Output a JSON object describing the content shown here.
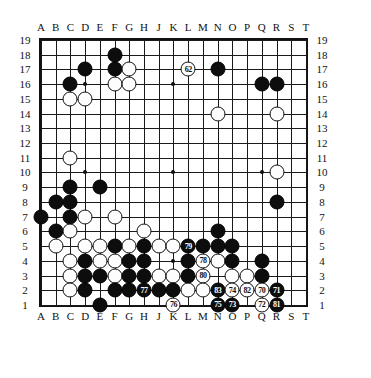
{
  "board": {
    "size": 19,
    "col_labels": [
      "A",
      "B",
      "C",
      "D",
      "E",
      "F",
      "G",
      "H",
      "J",
      "K",
      "L",
      "M",
      "N",
      "O",
      "P",
      "Q",
      "R",
      "S",
      "T"
    ],
    "row_labels_left": [
      "19",
      "18",
      "17",
      "16",
      "15",
      "14",
      "13",
      "12",
      "11",
      "10",
      "9",
      "8",
      "7",
      "6",
      "5",
      "4",
      "3",
      "2",
      "1"
    ],
    "row_labels_right": [
      "19",
      "18",
      "17",
      "16",
      "15",
      "14",
      "13",
      "12",
      "11",
      "10",
      "9",
      "8",
      "7",
      "6",
      "5",
      "4",
      "3",
      "2",
      "1"
    ],
    "colors": {
      "black": "#0d0d0d",
      "white": "#fdfdfd",
      "line": "#1a1a1a",
      "background": "#ffffff"
    },
    "hoshi": [
      {
        "col": "D",
        "row": 16
      },
      {
        "col": "K",
        "row": 16
      },
      {
        "col": "Q",
        "row": 16
      },
      {
        "col": "D",
        "row": 10
      },
      {
        "col": "K",
        "row": 10
      },
      {
        "col": "Q",
        "row": 10
      },
      {
        "col": "D",
        "row": 4
      },
      {
        "col": "K",
        "row": 4
      },
      {
        "col": "Q",
        "row": 4
      }
    ],
    "stones": [
      {
        "col": "F",
        "row": 18,
        "color": "black",
        "label": ""
      },
      {
        "col": "D",
        "row": 17,
        "color": "black",
        "label": ""
      },
      {
        "col": "F",
        "row": 17,
        "color": "black",
        "label": ""
      },
      {
        "col": "G",
        "row": 17,
        "color": "white",
        "label": ""
      },
      {
        "col": "L",
        "row": 17,
        "color": "white",
        "label": "62"
      },
      {
        "col": "N",
        "row": 17,
        "color": "black",
        "label": ""
      },
      {
        "col": "C",
        "row": 16,
        "color": "black",
        "label": ""
      },
      {
        "col": "F",
        "row": 16,
        "color": "white",
        "label": ""
      },
      {
        "col": "G",
        "row": 16,
        "color": "white",
        "label": ""
      },
      {
        "col": "Q",
        "row": 16,
        "color": "black",
        "label": ""
      },
      {
        "col": "R",
        "row": 16,
        "color": "black",
        "label": ""
      },
      {
        "col": "C",
        "row": 15,
        "color": "white",
        "label": ""
      },
      {
        "col": "D",
        "row": 15,
        "color": "white",
        "label": ""
      },
      {
        "col": "N",
        "row": 14,
        "color": "white",
        "label": ""
      },
      {
        "col": "R",
        "row": 14,
        "color": "white",
        "label": ""
      },
      {
        "col": "C",
        "row": 11,
        "color": "white",
        "label": ""
      },
      {
        "col": "R",
        "row": 10,
        "color": "white",
        "label": ""
      },
      {
        "col": "C",
        "row": 9,
        "color": "black",
        "label": ""
      },
      {
        "col": "E",
        "row": 9,
        "color": "black",
        "label": ""
      },
      {
        "col": "B",
        "row": 8,
        "color": "black",
        "label": ""
      },
      {
        "col": "C",
        "row": 8,
        "color": "black",
        "label": ""
      },
      {
        "col": "R",
        "row": 8,
        "color": "black",
        "label": ""
      },
      {
        "col": "A",
        "row": 7,
        "color": "black",
        "label": ""
      },
      {
        "col": "C",
        "row": 7,
        "color": "black",
        "label": ""
      },
      {
        "col": "D",
        "row": 7,
        "color": "white",
        "label": ""
      },
      {
        "col": "F",
        "row": 7,
        "color": "white",
        "label": ""
      },
      {
        "col": "B",
        "row": 6,
        "color": "black",
        "label": ""
      },
      {
        "col": "C",
        "row": 6,
        "color": "white",
        "label": ""
      },
      {
        "col": "H",
        "row": 6,
        "color": "white",
        "label": ""
      },
      {
        "col": "N",
        "row": 6,
        "color": "black",
        "label": ""
      },
      {
        "col": "B",
        "row": 5,
        "color": "white",
        "label": ""
      },
      {
        "col": "D",
        "row": 5,
        "color": "white",
        "label": ""
      },
      {
        "col": "E",
        "row": 5,
        "color": "white",
        "label": ""
      },
      {
        "col": "F",
        "row": 5,
        "color": "black",
        "label": ""
      },
      {
        "col": "G",
        "row": 5,
        "color": "white",
        "label": ""
      },
      {
        "col": "H",
        "row": 5,
        "color": "black",
        "label": ""
      },
      {
        "col": "J",
        "row": 5,
        "color": "white",
        "label": ""
      },
      {
        "col": "K",
        "row": 5,
        "color": "white",
        "label": ""
      },
      {
        "col": "L",
        "row": 5,
        "color": "black",
        "label": "79"
      },
      {
        "col": "M",
        "row": 5,
        "color": "black",
        "label": ""
      },
      {
        "col": "N",
        "row": 5,
        "color": "black",
        "label": ""
      },
      {
        "col": "O",
        "row": 5,
        "color": "black",
        "label": ""
      },
      {
        "col": "C",
        "row": 4,
        "color": "white",
        "label": ""
      },
      {
        "col": "D",
        "row": 4,
        "color": "black",
        "label": ""
      },
      {
        "col": "E",
        "row": 4,
        "color": "white",
        "label": ""
      },
      {
        "col": "F",
        "row": 4,
        "color": "white",
        "label": ""
      },
      {
        "col": "G",
        "row": 4,
        "color": "black",
        "label": ""
      },
      {
        "col": "H",
        "row": 4,
        "color": "black",
        "label": ""
      },
      {
        "col": "L",
        "row": 4,
        "color": "black",
        "label": ""
      },
      {
        "col": "M",
        "row": 4,
        "color": "white",
        "label": "78"
      },
      {
        "col": "N",
        "row": 4,
        "color": "white",
        "label": ""
      },
      {
        "col": "O",
        "row": 4,
        "color": "black",
        "label": ""
      },
      {
        "col": "Q",
        "row": 4,
        "color": "black",
        "label": ""
      },
      {
        "col": "C",
        "row": 3,
        "color": "white",
        "label": ""
      },
      {
        "col": "D",
        "row": 3,
        "color": "black",
        "label": ""
      },
      {
        "col": "E",
        "row": 3,
        "color": "black",
        "label": ""
      },
      {
        "col": "F",
        "row": 3,
        "color": "white",
        "label": ""
      },
      {
        "col": "G",
        "row": 3,
        "color": "black",
        "label": ""
      },
      {
        "col": "H",
        "row": 3,
        "color": "black",
        "label": ""
      },
      {
        "col": "J",
        "row": 3,
        "color": "white",
        "label": ""
      },
      {
        "col": "K",
        "row": 3,
        "color": "white",
        "label": ""
      },
      {
        "col": "L",
        "row": 3,
        "color": "black",
        "label": ""
      },
      {
        "col": "M",
        "row": 3,
        "color": "white",
        "label": "80"
      },
      {
        "col": "O",
        "row": 3,
        "color": "white",
        "label": ""
      },
      {
        "col": "P",
        "row": 3,
        "color": "white",
        "label": ""
      },
      {
        "col": "Q",
        "row": 3,
        "color": "black",
        "label": ""
      },
      {
        "col": "C",
        "row": 2,
        "color": "white",
        "label": ""
      },
      {
        "col": "D",
        "row": 2,
        "color": "black",
        "label": ""
      },
      {
        "col": "F",
        "row": 2,
        "color": "black",
        "label": ""
      },
      {
        "col": "G",
        "row": 2,
        "color": "black",
        "label": ""
      },
      {
        "col": "H",
        "row": 2,
        "color": "black",
        "label": "77"
      },
      {
        "col": "J",
        "row": 2,
        "color": "black",
        "label": ""
      },
      {
        "col": "K",
        "row": 2,
        "color": "black",
        "label": ""
      },
      {
        "col": "L",
        "row": 2,
        "color": "white",
        "label": ""
      },
      {
        "col": "M",
        "row": 2,
        "color": "white",
        "label": ""
      },
      {
        "col": "N",
        "row": 2,
        "color": "black",
        "label": "83"
      },
      {
        "col": "O",
        "row": 2,
        "color": "white",
        "label": "74"
      },
      {
        "col": "P",
        "row": 2,
        "color": "white",
        "label": "82"
      },
      {
        "col": "Q",
        "row": 2,
        "color": "white",
        "label": "70"
      },
      {
        "col": "R",
        "row": 2,
        "color": "black",
        "label": "71"
      },
      {
        "col": "E",
        "row": 1,
        "color": "black",
        "label": ""
      },
      {
        "col": "K",
        "row": 1,
        "color": "white",
        "label": "76"
      },
      {
        "col": "N",
        "row": 1,
        "color": "black",
        "label": "75"
      },
      {
        "col": "O",
        "row": 1,
        "color": "black",
        "label": "73"
      },
      {
        "col": "Q",
        "row": 1,
        "color": "white",
        "label": "72"
      },
      {
        "col": "R",
        "row": 1,
        "color": "black",
        "label": "81"
      }
    ]
  }
}
